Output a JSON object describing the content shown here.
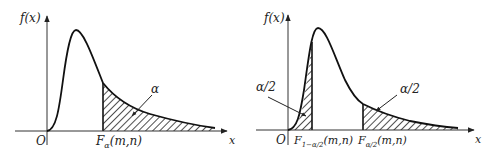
{
  "diagram": {
    "left_panel": {
      "y_axis_label": "f(x)",
      "x_axis_label": "x",
      "origin_label": "O",
      "critical_label_main": "F",
      "critical_label_sub": "α",
      "critical_label_args": "(m,n)",
      "area_label": "α",
      "shaded": "right tail"
    },
    "right_panel": {
      "y_axis_label": "f(x)",
      "x_axis_label": "x",
      "origin_label": "O",
      "lower_critical_main": "F",
      "lower_critical_sub": "1−α/2",
      "lower_critical_args": "(m,n)",
      "upper_critical_main": "F",
      "upper_critical_sub": "α/2",
      "upper_critical_args": "(m,n)",
      "left_area_label": "α/2",
      "right_area_label": "α/2",
      "shaded": "both tails"
    },
    "colors": {
      "curve": "#111111",
      "axis": "#333333",
      "hatch": "#222222"
    }
  }
}
